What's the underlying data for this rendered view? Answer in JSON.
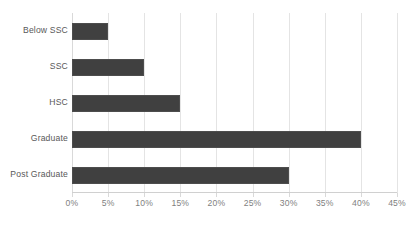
{
  "chart_data": {
    "type": "bar",
    "orientation": "horizontal",
    "title": "",
    "subtitle": "",
    "xlabel": "",
    "ylabel": "",
    "categories": [
      "Below SSC",
      "SSC",
      "HSC",
      "Graduate",
      "Post Graduate"
    ],
    "values": [
      5,
      10,
      15,
      40,
      30
    ],
    "value_suffix": "%",
    "xlim": [
      0,
      45
    ],
    "xticks": [
      0,
      5,
      10,
      15,
      20,
      25,
      30,
      35,
      40,
      45
    ],
    "xtick_labels": [
      "0%",
      "5%",
      "10%",
      "15%",
      "20%",
      "25%",
      "30%",
      "35%",
      "40%",
      "45%"
    ],
    "grid": true,
    "grid_axis": "x",
    "legend": false,
    "legend_position": "none",
    "data_labels": false,
    "series": [
      {
        "name": "",
        "values": [
          5,
          10,
          15,
          40,
          30
        ]
      }
    ]
  },
  "style": {
    "bar_color": "#404040",
    "bar_border_color": "#4d4d4d",
    "gridline_color": "#e4e4e4",
    "axis_line_color": "#d0d0d0",
    "category_label_color": "#595959",
    "tick_label_color": "#7f7f7f",
    "background_color": "#ffffff"
  }
}
